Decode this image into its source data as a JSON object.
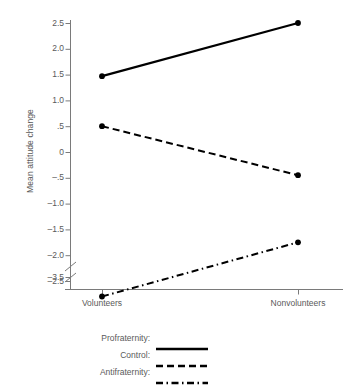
{
  "chart_data": {
    "type": "line",
    "title": "",
    "xlabel": "",
    "ylabel": "Mean attitude change",
    "categories": [
      "Volunteers",
      "Nonvolunteers"
    ],
    "ylim": [
      -3.5,
      2.75
    ],
    "grid": false,
    "legend_position": "below",
    "axis_break": {
      "present": true,
      "between": [
        -2.5,
        -3.5
      ]
    },
    "ytick_labels": [
      "2.5",
      "2.0",
      "1.5",
      "1.0",
      ".5",
      "0",
      "-.5",
      "-1.0",
      "-1.5",
      "-2.0",
      "-2.5",
      "-3.5"
    ],
    "ytick_values": [
      2.5,
      2.0,
      1.5,
      1.0,
      0.5,
      0,
      -0.5,
      -1.0,
      -1.5,
      -2.0,
      -2.5,
      -3.5
    ],
    "series": [
      {
        "name": "Profraternity",
        "legend_label": "Profraternity:",
        "style": "solid",
        "color": "#000000",
        "values": [
          1.47,
          2.5
        ]
      },
      {
        "name": "Control",
        "legend_label": "Control:",
        "style": "dashed",
        "color": "#000000",
        "values": [
          0.5,
          -0.45
        ]
      },
      {
        "name": "Antifraternity",
        "legend_label": "Antifraternity:",
        "style": "dashdot",
        "color": "#000000",
        "values": [
          -2.8,
          -1.75
        ]
      }
    ]
  },
  "axis": {
    "line_color": "#7a7a7a"
  }
}
